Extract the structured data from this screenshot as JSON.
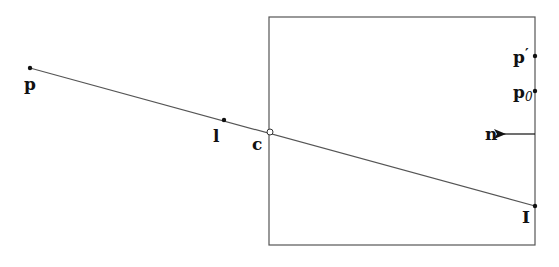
{
  "diagram": {
    "colors": {
      "stroke": "#555555",
      "point": "#111111",
      "label": "#111111",
      "background": "#ffffff"
    },
    "box": {
      "x": 269,
      "y": 17,
      "width": 266,
      "height": 228
    },
    "ray": {
      "from": "p",
      "to": "I",
      "x1": 30,
      "y1": 68,
      "x2": 535,
      "y2": 206
    },
    "points": [
      {
        "id": "p",
        "label": "p",
        "x": 30,
        "y": 68,
        "label_x": 24,
        "label_y": 90,
        "style": "filled"
      },
      {
        "id": "l",
        "label": "l",
        "x": 224,
        "y": 120,
        "label_x": 213,
        "label_y": 142,
        "style": "filled"
      },
      {
        "id": "c",
        "label": "c",
        "x": 270,
        "y": 132,
        "label_x": 252,
        "label_y": 150,
        "style": "hollow"
      },
      {
        "id": "p_prime",
        "label": "p",
        "sup": "′",
        "x": 535,
        "y": 56,
        "label_x": 513,
        "label_y": 63,
        "style": "filled"
      },
      {
        "id": "p0",
        "label": "p",
        "sub": "0",
        "x": 535,
        "y": 91,
        "label_x": 513,
        "label_y": 98,
        "style": "filled"
      },
      {
        "id": "I",
        "label": "I",
        "x": 535,
        "y": 206,
        "label_x": 522,
        "label_y": 223,
        "style": "filled"
      }
    ],
    "normal": {
      "label": "n",
      "x1": 535,
      "y1": 134,
      "x2": 504,
      "y2": 134,
      "label_x": 485,
      "label_y": 140
    }
  }
}
